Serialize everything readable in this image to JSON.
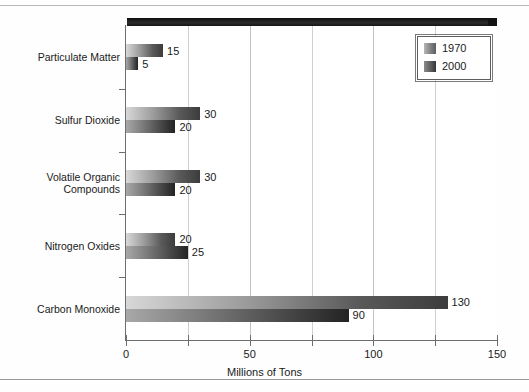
{
  "chart_data": {
    "type": "bar",
    "orientation": "horizontal",
    "title": "",
    "xlabel": "Millions of Tons",
    "ylabel": "",
    "xlim": [
      0,
      150
    ],
    "xticks": [
      "0",
      "50",
      "100",
      "150"
    ],
    "xtick_values": [
      0,
      50,
      100,
      150
    ],
    "minor_tick_values": [
      25,
      75,
      125
    ],
    "gridlines": [
      25,
      50,
      75,
      100,
      125
    ],
    "grid": true,
    "legend_position": "top-right",
    "categories": [
      "Particulate Matter",
      "Sulfur Dioxide",
      "Volatile Organic\nCompounds",
      "Nitrogen Oxides",
      "Carbon Monoxide"
    ],
    "series": [
      {
        "name": "1970",
        "values": [
          15,
          30,
          30,
          20,
          130
        ],
        "color": "#5a5a5a"
      },
      {
        "name": "2000",
        "values": [
          5,
          20,
          20,
          25,
          90
        ],
        "color": "#2a2a2a"
      }
    ],
    "data_labels": [
      {
        "category": "Particulate Matter",
        "series": "1970",
        "value": "15"
      },
      {
        "category": "Particulate Matter",
        "series": "2000",
        "value": "5"
      },
      {
        "category": "Sulfur Dioxide",
        "series": "1970",
        "value": "30"
      },
      {
        "category": "Sulfur Dioxide",
        "series": "2000",
        "value": "20"
      },
      {
        "category": "Volatile Organic Compounds",
        "series": "1970",
        "value": "30"
      },
      {
        "category": "Volatile Organic Compounds",
        "series": "2000",
        "value": "20"
      },
      {
        "category": "Nitrogen Oxides",
        "series": "1970",
        "value": "20"
      },
      {
        "category": "Nitrogen Oxides",
        "series": "2000",
        "value": "25"
      },
      {
        "category": "Carbon Monoxide",
        "series": "1970",
        "value": "130"
      },
      {
        "category": "Carbon Monoxide",
        "series": "2000",
        "value": "90"
      }
    ]
  },
  "legend": {
    "entries": [
      {
        "label": "1970"
      },
      {
        "label": "2000"
      }
    ]
  },
  "axis": {
    "x_title": "Millions of Tons"
  }
}
